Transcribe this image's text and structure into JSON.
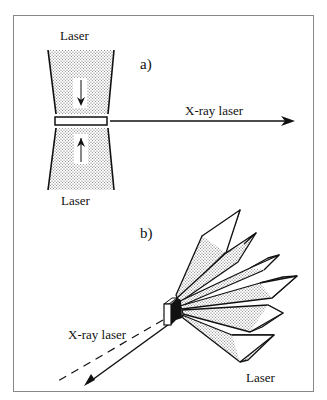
{
  "panel_a": {
    "label": "a)",
    "laser_top_label": "Laser",
    "laser_bottom_label": "Laser",
    "xray_label": "X-ray laser"
  },
  "panel_b": {
    "label": "b)",
    "xray_label": "X-ray laser",
    "laser_label": "Laser"
  },
  "colors": {
    "line": "#111111",
    "frame": "#888888",
    "stipple": "#555555"
  }
}
